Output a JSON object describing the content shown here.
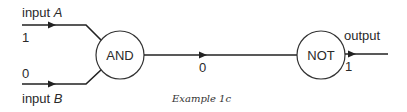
{
  "diagram": {
    "inputs": [
      {
        "label_prefix": "input ",
        "label_var": "A",
        "value": "1"
      },
      {
        "label_prefix": "input ",
        "label_var": "B",
        "value": "0"
      }
    ],
    "gates": [
      {
        "type": "AND",
        "label": "AND"
      },
      {
        "type": "NOT",
        "label": "NOT"
      }
    ],
    "intermediate_value": "0",
    "output": {
      "label": "output",
      "value": "1"
    },
    "caption": "Example 1c"
  },
  "colors": {
    "stroke": "#222222",
    "text": "#2a2a2a",
    "background": "#ffffff"
  }
}
